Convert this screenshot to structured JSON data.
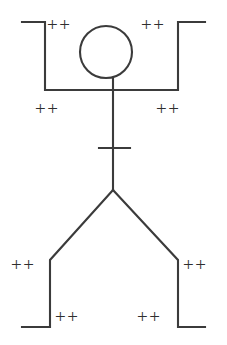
{
  "diagram": {
    "type": "line-drawing",
    "canvas": {
      "width": 227,
      "height": 345
    },
    "colors": {
      "stroke": "#3b3b3b",
      "background": "#ffffff",
      "label_text": "#2f2f2f"
    },
    "geometry": {
      "head": {
        "cx": 106,
        "cy": 52,
        "r": 26
      },
      "neck": {
        "x": 113,
        "y1": 78,
        "y2": 190
      },
      "crossbar": {
        "y": 148,
        "x1": 99,
        "x2": 130
      },
      "shoulder_line": {
        "y": 90,
        "x1": 45,
        "x2": 178
      },
      "left_arm": {
        "top_y": 22,
        "hand_x": 22,
        "elbow_x": 45
      },
      "right_arm": {
        "top_y": 22,
        "hand_x": 205,
        "elbow_x": 178
      },
      "hip": {
        "x": 113,
        "y": 190
      },
      "left_leg": {
        "knee_x": 50,
        "knee_y": 260,
        "ankle_y": 327,
        "foot_x": 22
      },
      "right_leg": {
        "knee_x": 178,
        "knee_y": 260,
        "ankle_y": 327,
        "foot_x": 205
      }
    },
    "labels": [
      {
        "name": "label-left-shoulder-top",
        "text": "++",
        "x": 47,
        "y": 15
      },
      {
        "name": "label-right-shoulder-top",
        "text": "++",
        "x": 141,
        "y": 15
      },
      {
        "name": "label-left-armpit",
        "text": "++",
        "x": 35,
        "y": 99
      },
      {
        "name": "label-right-armpit",
        "text": "++",
        "x": 156,
        "y": 99
      },
      {
        "name": "label-left-knee",
        "text": "++",
        "x": 11,
        "y": 255
      },
      {
        "name": "label-right-knee",
        "text": "++",
        "x": 183,
        "y": 255
      },
      {
        "name": "label-left-foot",
        "text": "++",
        "x": 55,
        "y": 307
      },
      {
        "name": "label-right-foot",
        "text": "++",
        "x": 137,
        "y": 307
      }
    ],
    "paths": {
      "left_arm_path": "M 22 22 L 45 22 L 45 90 L 113 90",
      "right_arm_path": "M 205 22 L 178 22 L 178 90 L 113 90",
      "neck_path": "M 113 78 L 113 190",
      "crossbar_path": "M 99 148 L 130 148",
      "left_leg_path": "M 113 190 L 50 260 L 50 327 L 22 327",
      "right_leg_path": "M 113 190 L 178 260 L 178 327 L 205 327"
    }
  }
}
